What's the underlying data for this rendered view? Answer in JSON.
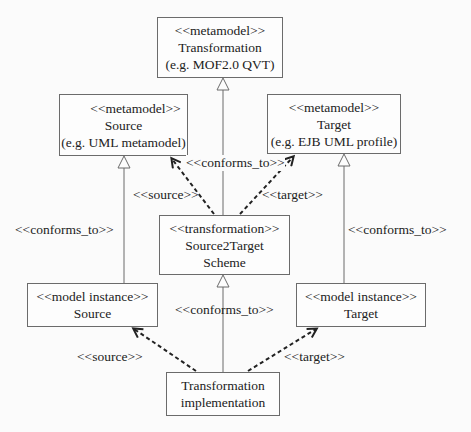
{
  "diagram": {
    "nodes": {
      "transformation_metamodel": {
        "stereotype": "<<metamodel>>",
        "name": "Transformation",
        "example": "(e.g. MOF2.0 QVT)"
      },
      "source_metamodel": {
        "stereotype": "<<metamodel>>",
        "name": "Source",
        "example": "(e.g. UML metamodel)"
      },
      "target_metamodel": {
        "stereotype": "<<metamodel>>",
        "name": "Target",
        "example": "(e.g. EJB UML profile)"
      },
      "scheme": {
        "stereotype": "<<transformation>>",
        "name": "Source2Target",
        "name2": "Scheme"
      },
      "source_instance": {
        "stereotype": "<<model instance>>",
        "name": "Source"
      },
      "target_instance": {
        "stereotype": "<<model instance>>",
        "name": "Target"
      },
      "implementation": {
        "name": "Transformation",
        "name2": "implementation"
      }
    },
    "edge_labels": {
      "scheme_conforms": "<<conforms_to>>",
      "scheme_source": "<<source>>",
      "scheme_target": "<<target>>",
      "source_conforms": "<<conforms_to>>",
      "target_conforms": "<<conforms_to>>",
      "impl_conforms": "<<conforms_to>>",
      "impl_source": "<<source>>",
      "impl_target": "<<target>>"
    },
    "colors": {
      "line": "#6b6b6b",
      "dashed": "#222222",
      "text": "#222222"
    }
  }
}
